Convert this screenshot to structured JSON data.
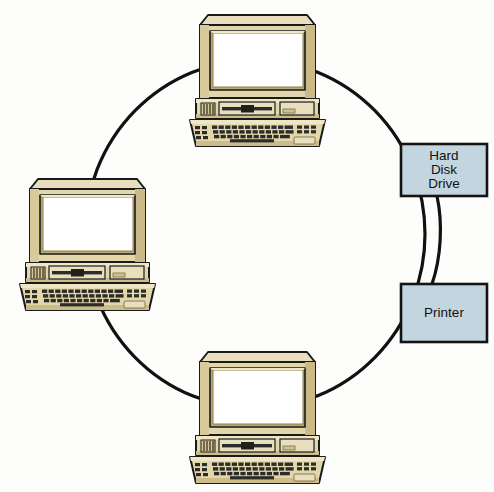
{
  "diagram": {
    "type": "ring-network-topology",
    "background_color": "#fdfdfb",
    "ring": {
      "name": "network-ring-cable",
      "stroke_color": "#111111",
      "stroke_width": 3.2,
      "center_x": 255,
      "center_y": 234,
      "radius_x": 170,
      "radius_y": 174
    },
    "palette": {
      "case_light": "#efe6c6",
      "case_base": "#e2d6ab",
      "case_mid": "#d6c795",
      "case_shadow": "#bba972",
      "case_dark": "#9e8c58",
      "outline": "#1a1a1a",
      "screen": "#ffffff",
      "key_dark": "#2b2b28",
      "device_fill": "#c3d6e0",
      "device_stroke": "#141414",
      "text": "#111111"
    },
    "nodes": [
      {
        "id": "computer-top",
        "kind": "computer",
        "name": "computer-workstation-top",
        "label": "",
        "x": 186,
        "y": 6,
        "width": 143,
        "height": 140
      },
      {
        "id": "computer-left",
        "kind": "computer",
        "name": "computer-workstation-left",
        "label": "",
        "x": 16,
        "y": 170,
        "width": 143,
        "height": 140
      },
      {
        "id": "computer-bottom",
        "kind": "computer",
        "name": "computer-workstation-bottom",
        "label": "",
        "x": 186,
        "y": 343,
        "width": 143,
        "height": 140
      },
      {
        "id": "hard-disk-drive",
        "kind": "device",
        "name": "hard-disk-drive-node",
        "label_lines": [
          "Hard",
          "Disk",
          "Drive"
        ],
        "x": 401,
        "y": 144,
        "width": 86,
        "height": 52
      },
      {
        "id": "printer",
        "kind": "device",
        "name": "printer-node",
        "label_lines": [
          "Printer"
        ],
        "x": 401,
        "y": 284,
        "width": 86,
        "height": 58
      }
    ],
    "links": [
      {
        "name": "link-hdd-to-printer",
        "from": "hard-disk-drive",
        "to": "printer"
      }
    ]
  }
}
